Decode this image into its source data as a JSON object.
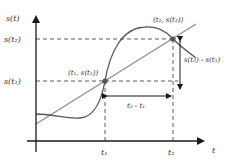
{
  "diagram": {
    "axes": {
      "y_label": "s(t)",
      "x_label": "t"
    },
    "y_ticks": [
      {
        "label": "s(t₂)"
      },
      {
        "label": "s(t₁)"
      }
    ],
    "x_ticks": [
      {
        "label": "t₁"
      },
      {
        "label": "t₂"
      }
    ],
    "points": [
      {
        "label": "(t₁, s(t₁))"
      },
      {
        "label": "(t₂, s(t₂))"
      }
    ],
    "annotations": {
      "horizontal_difference": "t₂ - t₁",
      "vertical_difference": "s(t₂) - s(t₁)"
    },
    "colors": {
      "axis": "#1a1a1a",
      "curve": "#555555",
      "secant": "#8a8a8a",
      "dashed": "#333333",
      "point": "#555555"
    }
  }
}
